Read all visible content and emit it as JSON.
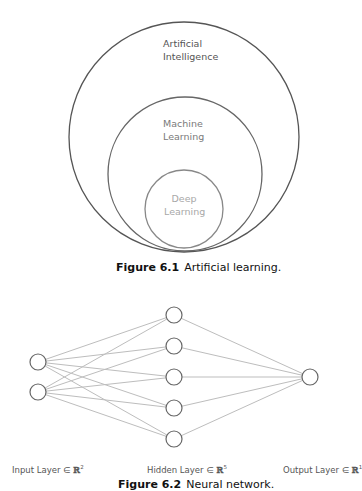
{
  "figure1": {
    "caption_number": "Figure 6.1",
    "caption_text": "Artificial learning.",
    "circles": [
      {
        "name": "ai",
        "line1": "Artificial",
        "line2": "Intelligence",
        "stroke": "#555555",
        "cx": 184,
        "cy": 137,
        "r": 115
      },
      {
        "name": "ml",
        "line1": "Machine",
        "line2": "Learning",
        "stroke": "#666666",
        "cx": 185,
        "cy": 174,
        "r": 77
      },
      {
        "name": "dl",
        "line1": "Deep",
        "line2": "Learning",
        "stroke": "#888888",
        "cx": 184,
        "cy": 209,
        "r": 39
      }
    ]
  },
  "figure2": {
    "caption_number": "Figure 6.2",
    "caption_text": "Neural network.",
    "layers": {
      "input": {
        "label": "Input Layer ∈ ",
        "space": "ℝ",
        "dim": "2",
        "nodes": 2
      },
      "hidden": {
        "label": "Hidden Layer ∈ ",
        "space": "ℝ",
        "dim": "5",
        "nodes": 5
      },
      "output": {
        "label": "Output Layer ∈ ",
        "space": "ℝ",
        "dim": "1",
        "nodes": 1
      }
    },
    "node_positions": {
      "input": [
        [
          38,
          362
        ],
        [
          38,
          392
        ]
      ],
      "hidden": [
        [
          174,
          315
        ],
        [
          174,
          346
        ],
        [
          174,
          377
        ],
        [
          174,
          408
        ],
        [
          174,
          439
        ]
      ],
      "output": [
        [
          310,
          377
        ]
      ]
    },
    "colors": {
      "edge": "#bdbdbd",
      "node_stroke": "#666666"
    }
  }
}
